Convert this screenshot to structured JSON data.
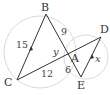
{
  "diagram": {
    "points": {
      "B": {
        "label": "B",
        "x": 46,
        "y": 14
      },
      "C": {
        "label": "C",
        "x": 17,
        "y": 80
      },
      "A": {
        "label": "A",
        "x": 68,
        "y": 59
      },
      "D": {
        "label": "D",
        "x": 101,
        "y": 37
      },
      "E": {
        "label": "E",
        "x": 81,
        "y": 77
      }
    },
    "segments": [
      {
        "from": "B",
        "to": "C",
        "label": "15",
        "parallel_mark": true
      },
      {
        "from": "B",
        "to": "A",
        "label": "9"
      },
      {
        "from": "C",
        "to": "A",
        "label": "12"
      },
      {
        "from": "A",
        "to": "E",
        "label": "6"
      },
      {
        "from": "A",
        "to": "D",
        "label": "y"
      },
      {
        "from": "D",
        "to": "E",
        "label": "x",
        "parallel_mark": true
      }
    ],
    "labels": {
      "B": "B",
      "C": "C",
      "A": "A",
      "D": "D",
      "E": "E",
      "bc": "15",
      "ba": "9",
      "ca": "12",
      "ae": "6",
      "y": "y",
      "x": "x"
    },
    "colors": {
      "line": "#333333",
      "circle": "#cccccc"
    }
  }
}
